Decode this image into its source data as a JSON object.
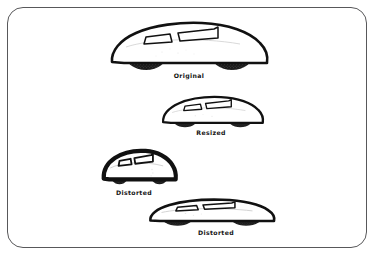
{
  "figure": {
    "background_color": "#ffffff",
    "border_color": "#58585a",
    "ink_color": "#111111",
    "wheel_color": "#1a1a1a",
    "body_fill": "#ffffff",
    "items": [
      {
        "id": "original",
        "caption": "Original",
        "variant": "original",
        "description": "Full size streamlined car, correct proportions",
        "width_px": 168,
        "height_px": 62
      },
      {
        "id": "resized",
        "caption": "Resized",
        "variant": "proportional-scale",
        "description": "Uniformly scaled down copy, proportions preserved",
        "width_px": 108,
        "height_px": 41
      },
      {
        "id": "distorted-tall",
        "caption": "Distorted",
        "variant": "horizontal-compression",
        "description": "Compressed horizontally, car appears tall and stubby",
        "width_px": 78,
        "height_px": 44
      },
      {
        "id": "distorted-wide",
        "caption": "Distorted",
        "variant": "vertical-compression",
        "description": "Stretched horizontally, car appears low and flattened",
        "width_px": 134,
        "height_px": 33
      }
    ]
  }
}
